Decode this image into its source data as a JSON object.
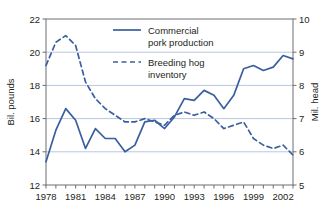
{
  "chart_data": {
    "type": "line",
    "title": "",
    "xlabel": "",
    "ylabel": "Bil. pounds",
    "y2label": "Mil. head",
    "grid": true,
    "legend_position": "top-center",
    "xlim": [
      1978,
      2003
    ],
    "ylim": [
      12,
      22
    ],
    "y2lim": [
      5,
      10
    ],
    "yticks": [
      12,
      14,
      16,
      18,
      20,
      22
    ],
    "y2ticks": [
      5,
      6,
      7,
      8,
      9,
      10
    ],
    "xticks": [
      1978,
      1979,
      1980,
      1981,
      1982,
      1983,
      1984,
      1985,
      1986,
      1987,
      1988,
      1989,
      1990,
      1991,
      1992,
      1993,
      1994,
      1995,
      1996,
      1997,
      1998,
      1999,
      2000,
      2001,
      2002,
      2003
    ],
    "xticklabels": [
      "1978",
      "",
      "",
      "1981",
      "",
      "",
      "1984",
      "",
      "",
      "1987",
      "",
      "",
      "1990",
      "",
      "",
      "1993",
      "",
      "",
      "1996",
      "",
      "",
      "1999",
      "",
      "",
      "2002",
      ""
    ],
    "x": [
      1978,
      1979,
      1980,
      1981,
      1982,
      1983,
      1984,
      1985,
      1986,
      1987,
      1988,
      1989,
      1990,
      1991,
      1992,
      1993,
      1994,
      1995,
      1996,
      1997,
      1998,
      1999,
      2000,
      2001,
      2002,
      2003
    ],
    "series": [
      {
        "name": "Commercial pork production",
        "axis": "left",
        "units": "Bil. pounds",
        "style": "solid",
        "color": "#3a5f9e",
        "values": [
          13.4,
          15.3,
          16.6,
          15.9,
          14.2,
          15.4,
          14.8,
          14.8,
          14.0,
          14.4,
          15.8,
          15.9,
          15.4,
          16.1,
          17.2,
          17.1,
          17.7,
          17.4,
          16.6,
          17.4,
          19.0,
          19.2,
          18.9,
          19.1,
          19.8,
          19.6
        ]
      },
      {
        "name": "Breeding hog inventory",
        "axis": "right",
        "units": "Mil. head",
        "style": "dashed",
        "color": "#3a5f9e",
        "values": [
          8.6,
          9.3,
          9.5,
          9.2,
          8.1,
          7.6,
          7.3,
          7.1,
          6.9,
          6.9,
          7.0,
          6.9,
          6.8,
          7.1,
          7.2,
          7.1,
          7.2,
          7.0,
          6.7,
          6.8,
          6.9,
          6.4,
          6.2,
          6.1,
          6.2,
          5.9
        ]
      }
    ]
  },
  "axes": {
    "left_title": "Bil. pounds",
    "right_title": "Mil. head"
  },
  "legend": {
    "items": [
      {
        "label_line1": "Commercial",
        "label_line2": "pork production",
        "style": "solid"
      },
      {
        "label_line1": "Breeding hog",
        "label_line2": "inventory",
        "style": "dashed"
      }
    ]
  }
}
